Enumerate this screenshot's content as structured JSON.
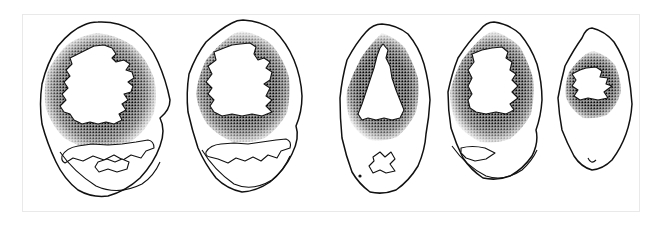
{
  "figure": {
    "kind": "scientific-illustration",
    "medium": "pen-and-ink stipple drawing",
    "subject": "series of five transverse cross-sections",
    "arrangement": "single horizontal row, left to right, decreasing size",
    "panel_count": 5,
    "background_color": "#ffffff",
    "ink_color": "#000000",
    "frame_color": "#e9e9e9",
    "frame": {
      "x": 22,
      "y": 14,
      "width": 618,
      "height": 198
    },
    "canvas": {
      "width": 663,
      "height": 229
    }
  },
  "chart_data": {
    "type": "diagram",
    "title": "",
    "xlabel": "",
    "ylabel": "",
    "categories": [
      "1",
      "2",
      "3",
      "4",
      "5"
    ],
    "values": [
      148,
      137,
      121,
      118,
      95
    ],
    "series": [
      {
        "name": "outline_height_px",
        "values": [
          188,
          178,
          170,
          160,
          135
        ]
      },
      {
        "name": "outline_width_px",
        "values": [
          148,
          137,
          121,
          118,
          95
        ]
      },
      {
        "name": "cavity_area_relative",
        "values": [
          1.0,
          0.92,
          0.63,
          0.66,
          0.18
        ]
      },
      {
        "name": "stipple_ring_thickness_px",
        "values": [
          22,
          23,
          24,
          26,
          21
        ]
      }
    ],
    "legend": [],
    "grid": false,
    "annotations": []
  },
  "panels": [
    {
      "id": "panel-1",
      "label": "",
      "position": {
        "cx": 100,
        "cy": 110
      },
      "outline": {
        "name": "outer-outline",
        "shape": "broad rounded ovoid, widest of the series, slightly lobed margin",
        "stroke_width": 1.4,
        "points": "98,22 118,23 134,31 148,45 158,62 165,82 170,100 168,112 160,118 163,130 160,146 152,162 140,178 124,190 108,196 92,196 78,190 66,178 56,162 48,144 42,124 40,104 42,84 48,64 58,46 72,32 84,25"
      },
      "stipple_ring": {
        "name": "stippled-cortex-band",
        "density": "dense black at inner edge fading outward",
        "outer": "97,34 116,37 131,46 143,60 151,77 155,95 153,112 145,128 132,140 115,147 97,149 80,146 65,138 54,125 47,109 44,92 47,74 55,58 67,45 82,37",
        "inner": "97,45 113,48 126,56 136,68 142,82 144,96 141,110 133,121 121,129 106,133 92,133 78,129 67,121 59,110 55,96 57,82 64,68 75,56 86,48"
      },
      "cavity": {
        "name": "inner-cavity",
        "shape": "large irregular cavity with strongly jagged right margin and a pointed notch at mid-left",
        "points": "94,46 104,45 112,48 116,54 112,58 116,62 124,60 130,64 126,70 132,72 134,78 128,82 133,86 131,92 124,94 128,100 122,104 126,110 119,114 122,120 114,124 106,122 98,124 90,122 82,124 74,120 70,114 64,112 60,106 66,100 62,94 68,88 64,82 70,76 66,70 72,64 70,58 78,54 86,50"
      },
      "lower_feature": {
        "name": "lower-lobe-outline",
        "present": true,
        "shape": "crescent band with serrated upper edge enclosing a second smaller lobe",
        "points": "64,150 76,146 90,144 106,145 120,144 132,142 142,140 150,142 152,148 144,150 140,156 130,154 122,158 114,154 104,158 94,156 84,160 74,158 66,162 62,158"
      },
      "lower_feature_2": {
        "name": "lower-inner-lobe",
        "present": true,
        "points": "98,160 106,158 114,160 120,158 126,160 124,166 116,168 108,166 100,168 96,164"
      }
    },
    {
      "id": "panel-2",
      "label": "",
      "position": {
        "cx": 245,
        "cy": 108
      },
      "outline": {
        "name": "outer-outline",
        "shape": "tall ovoid, narrower than panel 1, gently undulating margin",
        "stroke_width": 1.4,
        "points": "243,20 260,22 274,30 286,44 294,60 300,78 302,96 300,112 296,126 298,138 292,154 282,170 270,182 256,190 242,192 228,188 216,178 206,164 198,148 192,130 188,112 186,94 189,74 196,56 206,42 220,30 232,23"
      },
      "stipple_ring": {
        "name": "stippled-cortex-band",
        "density": "dense black at inner edge fading outward",
        "outer": "242,32 259,36 272,46 282,60 288,77 290,95 287,112 279,127 266,137 250,142 234,142 219,136 207,125 199,110 196,94 198,77 205,61 216,47 229,37"
      },
      "cavity": {
        "name": "inner-cavity",
        "shape": "large cavity, smooth left margin, deeply serrated right margin, pointed left notch",
        "points": "240,44 250,43 256,47 254,54 258,60 264,58 270,62 266,68 272,72 270,80 264,84 270,88 266,96 272,100 266,106 272,112 262,116 252,114 242,116 232,114 222,116 214,112 210,106 214,100 208,94 212,88 206,82 212,74 208,66 216,60 214,52 224,48 232,45"
      },
      "lower_feature": {
        "name": "lower-lobe-outline",
        "present": true,
        "shape": "elongate crescent with toothed lower-right margin",
        "points": "208,148 220,144 234,143 248,144 262,142 274,140 284,139 290,142 288,148 280,150 276,156 268,154 262,160 254,156 246,160 238,158 230,162 222,158 214,156 208,152"
      },
      "lower_feature_2": {
        "name": "lower-inner-lobe",
        "present": false,
        "points": ""
      }
    },
    {
      "id": "panel-3",
      "label": "",
      "position": {
        "cx": 383,
        "cy": 108
      },
      "outline": {
        "name": "outer-outline",
        "shape": "narrow elongate ovoid, tallest relative to width, with a small basal projection",
        "stroke_width": 1.4,
        "points": "382,24 396,26 408,34 418,48 424,64 428,82 430,100 428,118 426,134 424,150 418,166 408,180 396,190 382,194 370,192 360,184 352,172 346,156 342,138 340,118 340,98 342,78 347,60 355,44 366,32"
      },
      "stipple_ring": {
        "name": "stippled-cortex-band",
        "density": "dense black ring, strongest on the inner margin",
        "outer": "382,34 394,38 404,48 412,62 417,78 419,95 416,112 409,126 398,136 384,141 370,140 358,133 350,121 346,106 347,90 352,74 361,58 371,44"
      },
      "cavity": {
        "name": "inner-cavity",
        "shape": "narrow triangular cavity, apex at top, broad serrated base",
        "points": "383,44 388,50 386,58 390,66 392,78 396,90 400,100 404,110 400,118 392,120 384,118 376,120 368,118 362,120 358,114 362,104 366,92 370,80 374,68 377,56 380,48"
      },
      "lower_feature": {
        "name": "lower-star-lobe",
        "present": true,
        "shape": "small star-shaped outline low on the section",
        "points": "374,156 380,152 384,156 390,152 394,158 390,164 394,170 386,172 380,170 374,172 370,166 374,160"
      },
      "lower_feature_2": {
        "name": "lower-inner-lobe",
        "present": false,
        "points": ""
      }
    },
    {
      "id": "panel-4",
      "label": "",
      "position": {
        "cx": 494,
        "cy": 105
      },
      "outline": {
        "name": "outer-outline",
        "shape": "ovoid slightly narrower than panel 3, with a flaring basal margin",
        "stroke_width": 1.4,
        "points": "494,22 508,25 520,34 530,48 537,64 541,82 542,100 540,116 536,130 538,142 532,156 522,168 510,176 496,180 483,178 472,170 463,158 456,144 451,128 448,110 448,92 451,74 458,58 468,42 480,30"
      },
      "stipple_ring": {
        "name": "stippled-cortex-band",
        "density": "broad dense stipple halo, darkest adjacent to the cavity",
        "outer": "494,32 508,37 519,47 527,61 532,78 534,96 531,113 523,128 511,138 496,143 481,142 467,135 457,123 451,108 450,92 454,76 462,60 474,45 484,36"
      },
      "cavity": {
        "name": "inner-cavity",
        "shape": "rounded cavity with a notched right margin and a small basal knob",
        "points": "492,48 502,47 508,52 506,58 512,62 510,70 516,74 512,80 518,86 512,92 518,98 510,104 514,110 506,114 496,112 486,114 476,112 470,108 468,100 472,94 468,86 472,78 468,70 474,62 472,54 482,50"
      },
      "lower_feature": {
        "name": "lower-wedge-lobe",
        "present": true,
        "shape": "small wedge-shaped outline on the lower left margin",
        "points": "462,148 474,146 486,148 494,152 486,158 476,160 468,158 462,154"
      },
      "lower_feature_2": {
        "name": "lower-inner-lobe",
        "present": false,
        "points": ""
      }
    },
    {
      "id": "panel-5",
      "label": "",
      "position": {
        "cx": 592,
        "cy": 103
      },
      "outline": {
        "name": "outer-outline",
        "shape": "smallest, narrow pointed ovoid with an angular upper-left shoulder",
        "stroke_width": 1.4,
        "points": "592,28 604,32 614,42 622,56 628,72 631,88 632,104 630,120 626,134 620,148 612,160 602,168 592,170 582,166 574,156 567,144 562,130 559,114 558,98 560,82 565,66 573,50 582,38"
      },
      "stipple_ring": {
        "name": "stippled-cortex-band",
        "density": "compact stipple halo, roughly circular, darkest at the cavity margin",
        "outer": "594,52 606,56 615,65 620,78 621,92 617,105 608,114 596,118 583,117 572,110 566,98 565,85 569,72 578,61 586,55"
      },
      "cavity": {
        "name": "inner-cavity",
        "shape": "small irregular cavity with a deep notch on the right and stepped left margin",
        "points": "586,68 596,67 602,71 600,77 608,78 606,84 612,86 604,92 608,98 598,100 588,98 580,100 574,96 578,90 572,86 576,80 572,74 580,70"
      },
      "lower_feature": {
        "name": "lower-lobe-outline",
        "present": false,
        "points": ""
      },
      "lower_feature_2": {
        "name": "lower-inner-lobe",
        "present": false,
        "points": ""
      }
    }
  ]
}
